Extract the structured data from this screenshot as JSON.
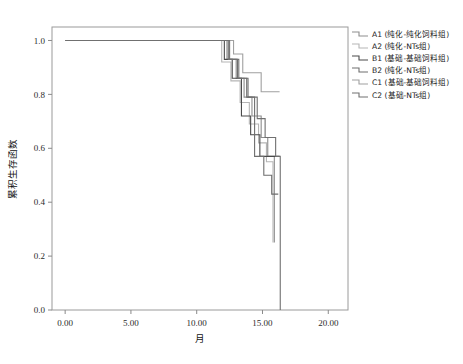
{
  "chart_data": {
    "type": "line",
    "title": "",
    "xlabel": "月",
    "ylabel": "累积生存函数",
    "xlim": [
      -1.0,
      21.5
    ],
    "ylim": [
      0.0,
      1.05
    ],
    "xticks": [
      "0.00",
      "5.00",
      "10.00",
      "15.00",
      "20.00"
    ],
    "xtick_values": [
      0,
      5,
      10,
      15,
      20
    ],
    "yticks": [
      "0.0",
      "0.2",
      "0.4",
      "0.6",
      "0.8",
      "1.0"
    ],
    "ytick_values": [
      0.0,
      0.2,
      0.4,
      0.6,
      0.8,
      1.0
    ],
    "grid": false,
    "legend_position": "right",
    "step_type": "post",
    "series": [
      {
        "name": "A1 (纯化-纯化饲料组)",
        "color": "#8d8d8d",
        "x": [
          0,
          11.6,
          12.3,
          13.0,
          13.6,
          14.2,
          14.9,
          15.4,
          15.9
        ],
        "y": [
          1.0,
          1.0,
          0.93,
          0.86,
          0.79,
          0.72,
          0.64,
          0.57,
          0.25
        ]
      },
      {
        "name": "A2 (纯化-NTs组)",
        "color": "#b5b5b5",
        "x": [
          0,
          11.2,
          11.9,
          12.6,
          13.3,
          14.0,
          14.7,
          15.3,
          15.8
        ],
        "y": [
          1.0,
          1.0,
          0.92,
          0.85,
          0.77,
          0.69,
          0.62,
          0.55,
          0.25
        ]
      },
      {
        "name": "B1 (基础-基础饲料组)",
        "color": "#4a4a4a",
        "x": [
          0,
          11.5,
          12.1,
          12.7,
          13.4,
          14.1,
          14.8,
          15.5,
          16.3
        ],
        "y": [
          1.0,
          1.0,
          0.93,
          0.86,
          0.72,
          0.65,
          0.57,
          0.57,
          0.57
        ]
      },
      {
        "name": "B2 (纯化-NTs组)",
        "color": "#6e6e6e",
        "x": [
          0,
          11.8,
          12.4,
          13.1,
          13.8,
          14.4,
          15.1,
          15.7,
          16.2
        ],
        "y": [
          1.0,
          1.0,
          0.93,
          0.86,
          0.79,
          0.57,
          0.5,
          0.43,
          0.43
        ]
      },
      {
        "name": "C1 (基础-基础饲料组)",
        "color": "#a0a0a0",
        "x": [
          0,
          12.0,
          12.8,
          13.5,
          14.2,
          14.9,
          15.5,
          16.1,
          16.3
        ],
        "y": [
          1.0,
          1.0,
          0.95,
          0.88,
          0.88,
          0.81,
          0.81,
          0.81,
          0.81
        ]
      },
      {
        "name": "C2 (基础-NTs组)",
        "color": "#707070",
        "x": [
          0,
          11.7,
          12.5,
          13.2,
          13.9,
          14.6,
          15.2,
          16.0,
          16.35,
          16.35
        ],
        "y": [
          1.0,
          1.0,
          0.93,
          0.86,
          0.79,
          0.71,
          0.64,
          0.57,
          0.57,
          0.0
        ]
      }
    ]
  },
  "legend": {
    "items": [
      {
        "label": "A1 (纯化-纯化饲料组)",
        "color": "#8d8d8d"
      },
      {
        "label": "A2 (纯化-NTs组)",
        "color": "#b5b5b5"
      },
      {
        "label": "B1 (基础-基础饲料组)",
        "color": "#4a4a4a"
      },
      {
        "label": "B2 (纯化-NTs组)",
        "color": "#6e6e6e"
      },
      {
        "label": "C1 (基础-基础饲料组)",
        "color": "#a0a0a0"
      },
      {
        "label": "C2 (基础-NTs组)",
        "color": "#707070"
      }
    ]
  },
  "axes": {
    "frame_color": "#9a9a9a",
    "tick_color": "#8a8a8a"
  }
}
